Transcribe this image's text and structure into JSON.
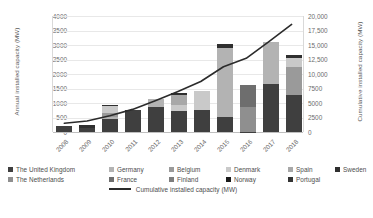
{
  "chart_data": {
    "type": "bar",
    "subtype": "stacked-bar-with-line",
    "title": "",
    "xlabel": "",
    "ylabel": "Annual installed capacity (MW)",
    "y2label": "Cumulative installed capacity (MW)",
    "categories": [
      "2008",
      "2009",
      "2010",
      "2011",
      "2012",
      "2013",
      "2014",
      "2015",
      "2016",
      "2017",
      "2018"
    ],
    "ylim": [
      0,
      4000
    ],
    "yticks": [
      "0",
      "500",
      "1000",
      "1500",
      "2000",
      "2500",
      "3000",
      "3500",
      "4000"
    ],
    "y2lim": [
      0,
      20000
    ],
    "y2ticks": [
      "0",
      "2500",
      "5000",
      "7500",
      "10,000",
      "12,500",
      "15,000",
      "17,500",
      "20,000"
    ],
    "grid": true,
    "legend_position": "bottom",
    "series": [
      {
        "name": "The United Kingdom",
        "color": "#3f3f3f",
        "values": [
          195,
          155,
          455,
          755,
          855,
          730,
          765,
          520,
          10,
          1670,
          1280
        ]
      },
      {
        "name": "Germany",
        "color": "#b3b3b3",
        "values": [
          0,
          0,
          50,
          0,
          290,
          0,
          0,
          2370,
          0,
          1450,
          0
        ]
      },
      {
        "name": "Belgium",
        "color": "#9a9a9a",
        "values": [
          0,
          0,
          165,
          0,
          0,
          0,
          0,
          0,
          0,
          0,
          950
        ]
      },
      {
        "name": "Denmark",
        "color": "#c9c9c9",
        "values": [
          0,
          0,
          215,
          0,
          0,
          215,
          650,
          0,
          0,
          0,
          330
        ]
      },
      {
        "name": "Spain",
        "color": "#a8a8a8",
        "values": [
          0,
          0,
          0,
          0,
          0,
          330,
          0,
          0,
          0,
          0,
          0
        ]
      },
      {
        "name": "Sweden",
        "color": "#2f2f2f",
        "values": [
          0,
          75,
          35,
          0,
          0,
          60,
          0,
          160,
          0,
          0,
          90
        ]
      },
      {
        "name": "The Netherlands",
        "color": "#8f8f8f",
        "values": [
          0,
          0,
          0,
          0,
          0,
          0,
          0,
          0,
          860,
          0,
          0
        ]
      },
      {
        "name": "France",
        "color": "#6e6e6e",
        "values": [
          0,
          0,
          0,
          0,
          0,
          0,
          0,
          0,
          760,
          0,
          0
        ]
      },
      {
        "name": "Finland",
        "color": "#7d7d7d",
        "values": [
          0,
          0,
          0,
          0,
          0,
          0,
          0,
          0,
          0,
          0,
          0
        ]
      },
      {
        "name": "Norway",
        "color": "#1a1a1a",
        "values": [
          0,
          0,
          0,
          0,
          0,
          0,
          0,
          0,
          0,
          0,
          0
        ]
      },
      {
        "name": "Portugal",
        "color": "#333333",
        "values": [
          0,
          0,
          0,
          0,
          0,
          0,
          0,
          0,
          0,
          0,
          0
        ]
      }
    ],
    "line_series": {
      "name": "Cumulative installed capacity (MW)",
      "color": "#2b2b2b",
      "axis": "right",
      "values": [
        1500,
        1900,
        2800,
        3900,
        5400,
        7000,
        8700,
        11250,
        12700,
        15600,
        18550
      ]
    }
  },
  "legend": {
    "row1": [
      {
        "label": "The United Kingdom",
        "color": "#3f3f3f"
      },
      {
        "label": "Germany",
        "color": "#b3b3b3"
      },
      {
        "label": "Belgium",
        "color": "#9a9a9a"
      },
      {
        "label": "Denmark",
        "color": "#c9c9c9"
      },
      {
        "label": "Spain",
        "color": "#a8a8a8"
      },
      {
        "label": "Sweden",
        "color": "#2f2f2f"
      }
    ],
    "row2": [
      {
        "label": "The Netherlands",
        "color": "#8f8f8f"
      },
      {
        "label": "France",
        "color": "#6e6e6e"
      },
      {
        "label": "Finland",
        "color": "#7d7d7d"
      },
      {
        "label": "Norway",
        "color": "#1a1a1a"
      },
      {
        "label": "Portugal",
        "color": "#333333"
      }
    ],
    "line_entry": {
      "label": "Cumulative installed capacity (MW)",
      "color": "#2b2b2b"
    }
  }
}
